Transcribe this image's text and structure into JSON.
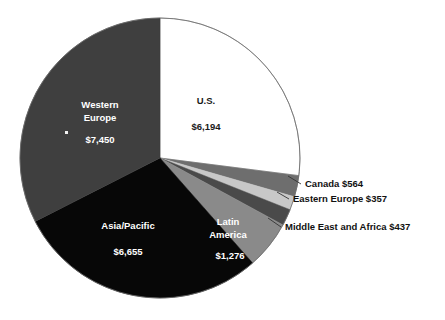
{
  "chart_data": {
    "type": "pie",
    "title": "",
    "subtitle": "",
    "xlabel": "",
    "ylabel": "",
    "legend_position": "none",
    "grid": false,
    "categories": [
      "U.S.",
      "Canada",
      "Eastern Europe",
      "Middle East and Africa",
      "Latin America",
      "Asia/Pacific",
      "Western Europe"
    ],
    "values": [
      6194,
      564,
      357,
      437,
      1276,
      6655,
      7450
    ],
    "value_labels": [
      "$6,194",
      "$564",
      "$357",
      "$437",
      "$1,276",
      "$6,655",
      "$7,450"
    ],
    "total": 22933,
    "start_angle_deg": 0,
    "direction": "clockwise",
    "slices": [
      {
        "name": "U.S.",
        "label": "U.S.",
        "value_label": "$6,194",
        "value": 6194,
        "color": "#ffffff",
        "text_color": "#1a1a1a",
        "label_placement": "inside",
        "label_x": 206,
        "label_y": 101,
        "value_x": 206,
        "value_y": 127
      },
      {
        "name": "Canada",
        "label": "Canada",
        "value_label": "$564",
        "value": 564,
        "color": "#6e6e6e",
        "text_color": "#111111",
        "label_placement": "callout",
        "callout_x": 305,
        "callout_y": 184,
        "leader_from_x": 288,
        "leader_from_y": 176,
        "leader_to_x": 301,
        "leader_to_y": 184
      },
      {
        "name": "Eastern Europe",
        "label": "Eastern Europe",
        "value_label": "$357",
        "value": 357,
        "color": "#c8c8c8",
        "text_color": "#111111",
        "label_placement": "callout",
        "callout_x": 293,
        "callout_y": 199,
        "leader_from_x": 277,
        "leader_from_y": 192,
        "leader_to_x": 289,
        "leader_to_y": 199
      },
      {
        "name": "Middle East and Africa",
        "label": "Middle East and Africa",
        "value_label": "$437",
        "value": 437,
        "color": "#4a4a4a",
        "text_color": "#111111",
        "label_placement": "callout",
        "callout_x": 285,
        "callout_y": 227,
        "leader_from_x": 268,
        "leader_from_y": 218,
        "leader_to_x": 281,
        "leader_to_y": 227
      },
      {
        "name": "Latin America",
        "label": "Latin America",
        "label_line_1": "Latin",
        "label_line_2": "America",
        "value_label": "$1,276",
        "value": 1276,
        "color": "#8a8a8a",
        "text_color": "#ffffff",
        "label_placement": "inside",
        "label_x": 228,
        "label_y": 222,
        "value_x": 230,
        "value_y": 256
      },
      {
        "name": "Asia/Pacific",
        "label": "Asia/Pacific",
        "value_label": "$6,655",
        "value": 6655,
        "color": "#070707",
        "text_color": "#ffffff",
        "label_placement": "inside",
        "label_x": 128,
        "label_y": 226,
        "value_x": 128,
        "value_y": 252
      },
      {
        "name": "Western Europe",
        "label": "Western Europe",
        "label_line_1": "Western",
        "label_line_2": "Europe",
        "value_label": "$7,450",
        "value": 7450,
        "color": "#3f3f3f",
        "text_color": "#ffffff",
        "label_placement": "inside",
        "label_x": 100,
        "label_y": 105,
        "value_x": 100,
        "value_y": 140
      }
    ],
    "geometry": {
      "center_x": 160,
      "center_y": 158,
      "radius": 140
    },
    "colors": {
      "background": "#ffffff",
      "outline": "#6b6b6b",
      "callout_text": "#111111",
      "leader_line": "#333333"
    }
  }
}
